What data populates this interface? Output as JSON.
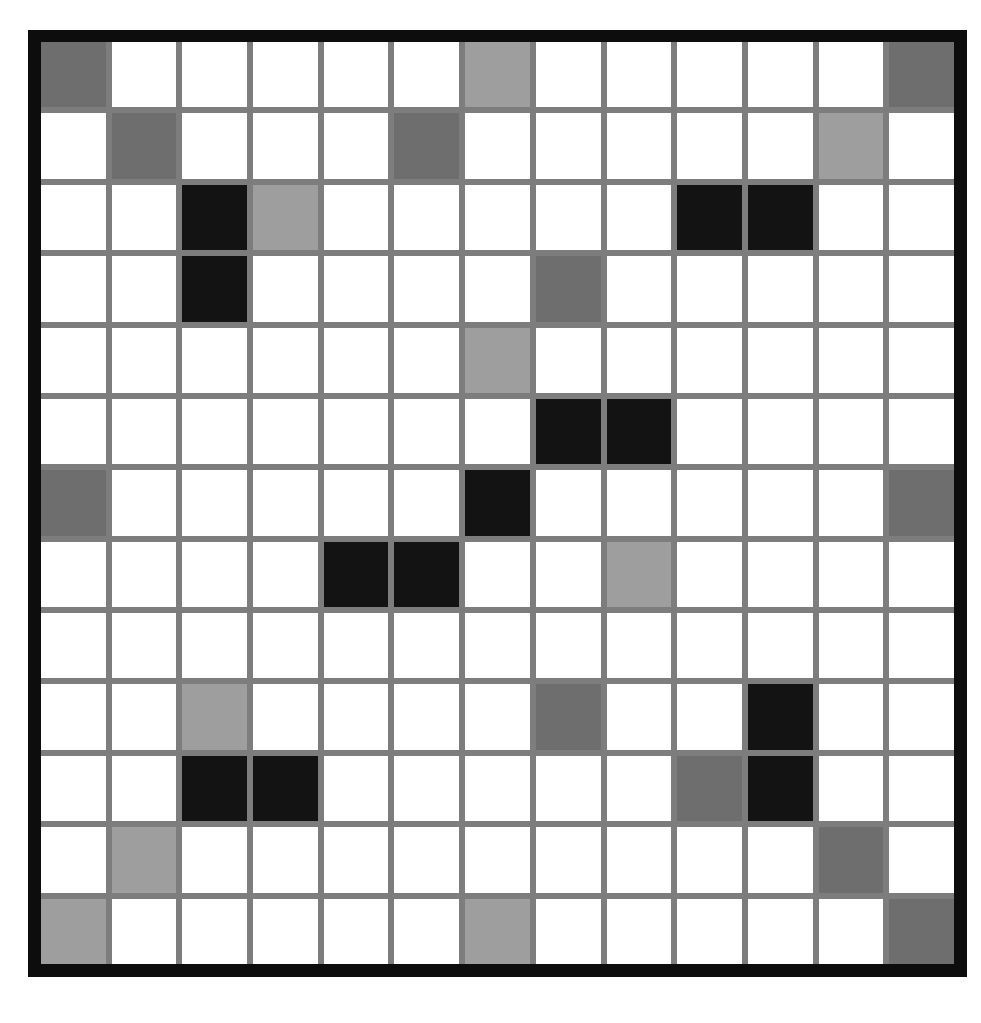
{
  "figure": {
    "name": "grayscale-grid-pattern",
    "kind": "heatmap",
    "rows": 13,
    "cols": 13,
    "frame_color": "#0d0d0d",
    "gridline_color": "#7d7d7d"
  },
  "legend": {
    "values": [
      "white",
      "light",
      "dark",
      "black"
    ],
    "colors": {
      "white": "#ffffff",
      "light": "#9e9e9e",
      "dark": "#6e6e6e",
      "black": "#131313"
    }
  },
  "chart_data": {
    "type": "heatmap",
    "title": "",
    "xlabel": "",
    "ylabel": "",
    "grid": true,
    "legend_position": "none",
    "categories": [
      "1",
      "2",
      "3",
      "4",
      "5",
      "6",
      "7",
      "8",
      "9",
      "10",
      "11",
      "12",
      "13"
    ],
    "row_labels": [
      "1",
      "2",
      "3",
      "4",
      "5",
      "6",
      "7",
      "8",
      "9",
      "10",
      "11",
      "12",
      "13"
    ],
    "color_scale": {
      "white": "#ffffff",
      "light": "#9e9e9e",
      "dark": "#6e6e6e",
      "black": "#131313"
    },
    "values": [
      [
        "dark",
        "white",
        "white",
        "white",
        "white",
        "white",
        "light",
        "white",
        "white",
        "white",
        "white",
        "white",
        "dark"
      ],
      [
        "white",
        "dark",
        "white",
        "white",
        "white",
        "dark",
        "white",
        "white",
        "white",
        "white",
        "white",
        "light",
        "white"
      ],
      [
        "white",
        "white",
        "black",
        "light",
        "white",
        "white",
        "white",
        "white",
        "white",
        "black",
        "black",
        "white",
        "white"
      ],
      [
        "white",
        "white",
        "black",
        "white",
        "white",
        "white",
        "white",
        "dark",
        "white",
        "white",
        "white",
        "white",
        "white"
      ],
      [
        "white",
        "white",
        "white",
        "white",
        "white",
        "white",
        "light",
        "white",
        "white",
        "white",
        "white",
        "white",
        "white"
      ],
      [
        "white",
        "white",
        "white",
        "white",
        "white",
        "white",
        "white",
        "black",
        "black",
        "white",
        "white",
        "white",
        "white"
      ],
      [
        "dark",
        "white",
        "white",
        "white",
        "white",
        "white",
        "black",
        "white",
        "white",
        "white",
        "white",
        "white",
        "dark"
      ],
      [
        "white",
        "white",
        "white",
        "white",
        "black",
        "black",
        "white",
        "white",
        "light",
        "white",
        "white",
        "white",
        "white"
      ],
      [
        "white",
        "white",
        "white",
        "white",
        "white",
        "white",
        "white",
        "white",
        "white",
        "white",
        "white",
        "white",
        "white"
      ],
      [
        "white",
        "white",
        "light",
        "white",
        "white",
        "white",
        "white",
        "dark",
        "white",
        "white",
        "black",
        "white",
        "white"
      ],
      [
        "white",
        "white",
        "black",
        "black",
        "white",
        "white",
        "white",
        "white",
        "white",
        "dark",
        "black",
        "white",
        "white"
      ],
      [
        "white",
        "light",
        "white",
        "white",
        "white",
        "white",
        "white",
        "white",
        "white",
        "white",
        "white",
        "dark",
        "white"
      ],
      [
        "light",
        "white",
        "white",
        "white",
        "white",
        "white",
        "light",
        "white",
        "white",
        "white",
        "white",
        "white",
        "dark"
      ]
    ]
  }
}
